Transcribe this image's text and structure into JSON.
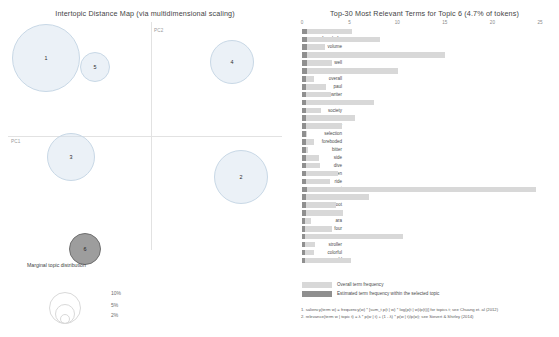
{
  "left_panel": {
    "title": "Intertopic Distance Map (via multidimensional scaling)",
    "axis": {
      "x_label": "PC2",
      "y_label": "PC1"
    },
    "topics": [
      {
        "id": "1",
        "label": "1",
        "cx": 38,
        "cy": 36,
        "r": 34,
        "selected": false
      },
      {
        "id": "5",
        "label": "5",
        "cx": 87,
        "cy": 45,
        "r": 15,
        "selected": false
      },
      {
        "id": "4",
        "label": "4",
        "cx": 224,
        "cy": 40,
        "r": 22,
        "selected": false
      },
      {
        "id": "3",
        "label": "3",
        "cx": 63,
        "cy": 135,
        "r": 24,
        "selected": false
      },
      {
        "id": "2",
        "label": "2",
        "cx": 233,
        "cy": 155,
        "r": 27,
        "selected": false
      },
      {
        "id": "6",
        "label": "6",
        "cx": 77,
        "cy": 227,
        "r": 16,
        "selected": true
      }
    ],
    "marginal_legend": {
      "title": "Marginal topic distribution",
      "sizes": [
        {
          "label": "2%",
          "r": 5
        },
        {
          "label": "5%",
          "r": 10
        },
        {
          "label": "10%",
          "r": 16
        }
      ]
    }
  },
  "right_panel": {
    "title": "Top-30 Most Relevant Terms for Topic 6 (4.7% of tokens)",
    "legend": {
      "overall_label": "Overall term frequency",
      "topic_label": "Estimated term frequency within the selected topic"
    },
    "footnotes": [
      "1. saliency(term w) = frequency(w) * [sum_t p(t | w) * log(p(t | w)/p(t))] for topics t; see Chuang et. al (2012)",
      "2. relevance(term w | topic t) = λ * p(w | t) + (1 - λ) * p(w | t)/p(w); see Sievert & Shirley (2014)"
    ]
  },
  "chart_data": {
    "type": "bar",
    "title": "Top-30 Most Relevant Terms for Topic 6 (4.7% of tokens)",
    "xlabel": "",
    "ylabel": "",
    "xlim": [
      0,
      25
    ],
    "xticks": [
      0,
      5,
      10,
      15,
      20,
      25
    ],
    "grid": false,
    "legend_position": "bottom-left",
    "orientation": "horizontal",
    "categories": [
      "red",
      "french_fry",
      "volume",
      "good",
      "well",
      "series",
      "overall",
      "paul",
      "writer",
      "blunt",
      "society",
      "end",
      "keeper",
      "selection",
      "foreboded",
      "bitter",
      "side",
      "dive",
      "golden",
      "ride",
      "not",
      "yellow",
      "foot",
      "family",
      "ara",
      "four",
      "collection",
      "stroller",
      "colorful",
      "old"
    ],
    "series": [
      {
        "name": "Overall term frequency",
        "values": [
          5.2,
          8.2,
          2.4,
          15.0,
          3.1,
          10.1,
          1.3,
          2.5,
          3.0,
          7.6,
          2.0,
          5.6,
          4.2,
          0.5,
          1.3,
          0.6,
          1.8,
          1.9,
          3.8,
          2.9,
          24.6,
          7.0,
          3.6,
          4.3,
          0.9,
          3.1,
          10.6,
          1.4,
          1.3,
          5.1
        ]
      },
      {
        "name": "Estimated term frequency within the selected topic",
        "values": [
          0.55,
          0.52,
          0.5,
          0.5,
          0.48,
          0.48,
          0.45,
          0.45,
          0.45,
          0.45,
          0.42,
          0.42,
          0.42,
          0.4,
          0.4,
          0.4,
          0.38,
          0.38,
          0.38,
          0.38,
          0.55,
          0.4,
          0.38,
          0.38,
          0.36,
          0.36,
          0.36,
          0.35,
          0.35,
          0.35
        ]
      }
    ]
  }
}
